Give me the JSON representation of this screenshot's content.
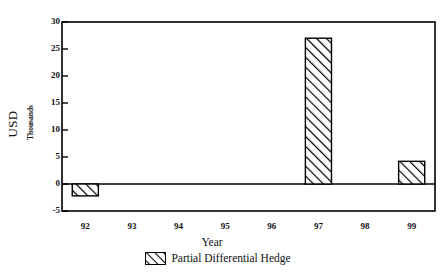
{
  "chart_data": {
    "type": "bar",
    "title": "",
    "xlabel": "Year",
    "ylabel": "USD",
    "ylabel_secondary": "Thousands",
    "categories": [
      "92",
      "93",
      "94",
      "95",
      "96",
      "97",
      "98",
      "99"
    ],
    "values": [
      -2.2,
      0,
      0,
      0,
      0,
      27,
      0,
      4.2
    ],
    "series": [
      {
        "name": "Partial Differential Hedge",
        "values": [
          -2.2,
          0,
          0,
          0,
          0,
          27,
          0,
          4.2
        ]
      }
    ],
    "ylim": [
      -5,
      30
    ],
    "yticks": [
      30,
      25,
      20,
      15,
      10,
      5,
      0,
      -5
    ],
    "ytick_labels": [
      "30",
      "25",
      "20",
      "15",
      "10",
      "5",
      "0",
      "-5"
    ],
    "xtick_labels": [
      "92",
      "93",
      "94",
      "95",
      "96",
      "97",
      "98",
      "99"
    ],
    "grid": false,
    "legend_position": "bottom",
    "legend_entries": [
      "Partial Differential Hedge"
    ],
    "bar_fill": "hatch-diagonal",
    "bar_edge_color": "#000000",
    "axis_color": "#000000",
    "background_color": "#ffffff"
  },
  "legend": {
    "label": "Partial Differential Hedge",
    "swatch_name": "hatched-swatch"
  },
  "axes": {
    "x_title": "Year",
    "y_title": "USD",
    "y_subtitle": "Thousands"
  }
}
